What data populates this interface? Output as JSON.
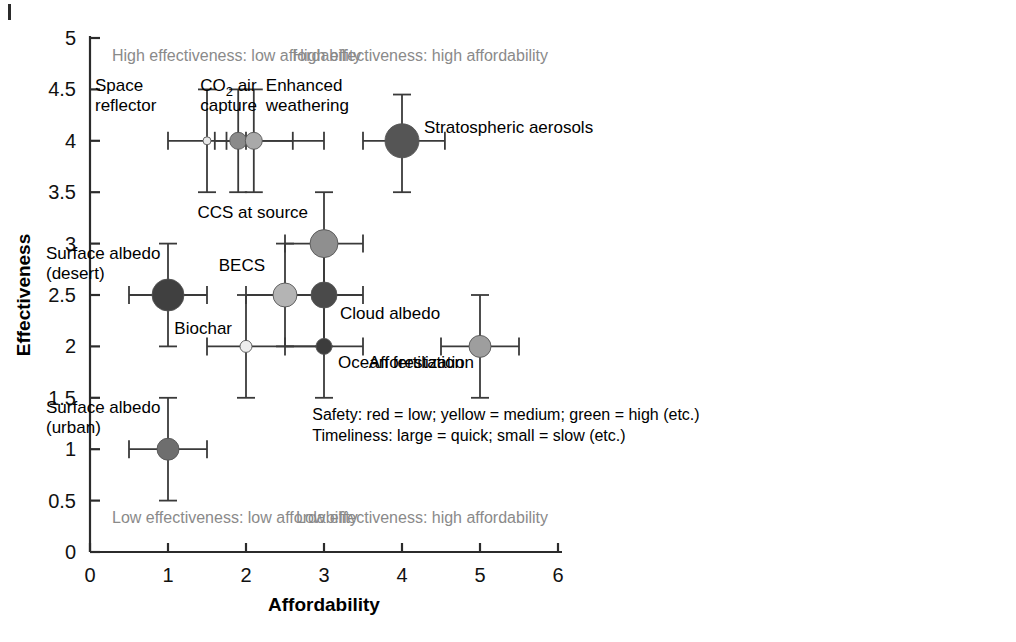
{
  "figure": {
    "x_axis_title": "Affordability",
    "y_axis_title": "Effectiveness",
    "corner_mark": "page-edge-mark"
  },
  "quadrant_labels": {
    "top_left": "High effectiveness: low affordability",
    "top_right": "High effectiveness: high affordability",
    "bottom_left": "Low effectiveness: low affordability",
    "bottom_right": "Low effectiveness: high affordability"
  },
  "legend": {
    "line1": "Safety: red = low; yellow = medium; green = high (etc.)",
    "line2": "Timeliness: large = quick; small = slow (etc.)"
  },
  "chart_data": {
    "type": "scatter",
    "title": "",
    "xlabel": "Affordability",
    "ylabel": "Effectiveness",
    "xlim": [
      0,
      6
    ],
    "ylim": [
      0,
      5
    ],
    "xticks": [
      "0",
      "1",
      "2",
      "3",
      "4",
      "5",
      "6"
    ],
    "yticks": [
      "0",
      "0.5",
      "1",
      "1.5",
      "2",
      "2.5",
      "3",
      "3.5",
      "4",
      "4.5",
      "5"
    ],
    "grid": false,
    "legend_position": "inside-lower-right",
    "encoding": {
      "marker_color": "safety (red=low, yellow=medium, green=high)",
      "marker_size": "timeliness (large=quick, small=slow)",
      "error_bars": "uncertainty range in both axes"
    },
    "points": [
      {
        "label": "Space reflector",
        "x": 1.5,
        "y": 4.0,
        "xerr_low": 1.0,
        "xerr_high": 2.0,
        "yerr_low": 3.5,
        "yerr_high": 4.5,
        "size": 8,
        "color": "#e8e8e8",
        "label_dx": -112,
        "label_dy": -50,
        "label_anchor": "start",
        "label_lines": [
          "Space",
          "reflector"
        ]
      },
      {
        "label": "CO2 air capture",
        "x": 1.9,
        "y": 4.0,
        "xerr_low": 1.6,
        "xerr_high": 2.6,
        "yerr_low": 3.5,
        "yerr_high": 4.5,
        "size": 17,
        "color": "#8a8a8a",
        "label_dx": -38,
        "label_dy": -50,
        "label_anchor": "start",
        "label_lines": [
          "CO₂ air",
          "capture"
        ]
      },
      {
        "label": "Enhanced weathering",
        "x": 2.1,
        "y": 4.0,
        "xerr_low": 1.75,
        "xerr_high": 3.0,
        "yerr_low": 3.5,
        "yerr_high": 4.5,
        "size": 17,
        "color": "#a9a9a9",
        "label_dx": 12,
        "label_dy": -50,
        "label_anchor": "start",
        "label_lines": [
          "Enhanced",
          "weathering"
        ]
      },
      {
        "label": "Stratospheric aerosols",
        "x": 4.0,
        "y": 4.0,
        "xerr_low": 3.5,
        "xerr_high": 4.55,
        "yerr_low": 3.5,
        "yerr_high": 4.45,
        "size": 34,
        "color": "#555555",
        "label_dx": 22,
        "label_dy": -8,
        "label_anchor": "start",
        "label_lines": [
          "Stratospheric aerosols"
        ]
      },
      {
        "label": "Surface albedo (desert)",
        "x": 1.0,
        "y": 2.5,
        "xerr_low": 0.5,
        "xerr_high": 1.5,
        "yerr_low": 2.0,
        "yerr_high": 3.0,
        "size": 32,
        "color": "#404040",
        "label_dx": -122,
        "label_dy": -36,
        "label_anchor": "start",
        "label_lines": [
          "Surface albedo",
          "(desert)"
        ]
      },
      {
        "label": "CCS at source",
        "x": 3.0,
        "y": 3.0,
        "xerr_low": 2.5,
        "xerr_high": 3.5,
        "yerr_low": 2.5,
        "yerr_high": 3.5,
        "size": 28,
        "color": "#8f8f8f",
        "label_dx": -16,
        "label_dy": -26,
        "label_anchor": "end",
        "label_lines": [
          "CCS at source"
        ]
      },
      {
        "label": "BECS",
        "x": 2.5,
        "y": 2.5,
        "xerr_low": 2.0,
        "xerr_high": 3.0,
        "yerr_low": 2.0,
        "yerr_high": 3.0,
        "size": 24,
        "color": "#b4b4b4",
        "label_dx": -20,
        "label_dy": -24,
        "label_anchor": "end",
        "label_lines": [
          "BECS"
        ]
      },
      {
        "label": "Cloud albedo",
        "x": 3.0,
        "y": 2.5,
        "xerr_low": 2.5,
        "xerr_high": 3.5,
        "yerr_low": 2.0,
        "yerr_high": 3.0,
        "size": 26,
        "color": "#4a4a4a",
        "label_dx": 16,
        "label_dy": 24,
        "label_anchor": "start",
        "label_lines": [
          "Cloud albedo"
        ]
      },
      {
        "label": "Biochar",
        "x": 2.0,
        "y": 2.0,
        "xerr_low": 1.5,
        "xerr_high": 3.0,
        "yerr_low": 1.5,
        "yerr_high": 2.5,
        "size": 12,
        "color": "#ededed",
        "label_dx": -14,
        "label_dy": -12,
        "label_anchor": "end",
        "label_lines": [
          "Biochar"
        ]
      },
      {
        "label": "Ocean fertilization",
        "x": 3.0,
        "y": 2.0,
        "xerr_low": 2.5,
        "xerr_high": 3.5,
        "yerr_low": 1.5,
        "yerr_high": 2.5,
        "size": 16,
        "color": "#3c3c3c",
        "label_dx": 14,
        "label_dy": 22,
        "label_anchor": "start",
        "label_lines": [
          "Ocean fertilization"
        ]
      },
      {
        "label": "Afforestation",
        "x": 5.0,
        "y": 2.0,
        "xerr_low": 4.5,
        "xerr_high": 5.5,
        "yerr_low": 1.5,
        "yerr_high": 2.5,
        "size": 22,
        "color": "#9e9e9e",
        "label_dx": -16,
        "label_dy": 22,
        "label_anchor": "end",
        "label_lines": [
          "Afforestation"
        ]
      },
      {
        "label": "Surface albedo (urban)",
        "x": 1.0,
        "y": 1.0,
        "xerr_low": 0.5,
        "xerr_high": 1.5,
        "yerr_low": 0.5,
        "yerr_high": 1.5,
        "size": 22,
        "color": "#6e6e6e",
        "label_dx": -122,
        "label_dy": -36,
        "label_anchor": "start",
        "label_lines": [
          "Surface albedo",
          "(urban)"
        ]
      }
    ]
  }
}
